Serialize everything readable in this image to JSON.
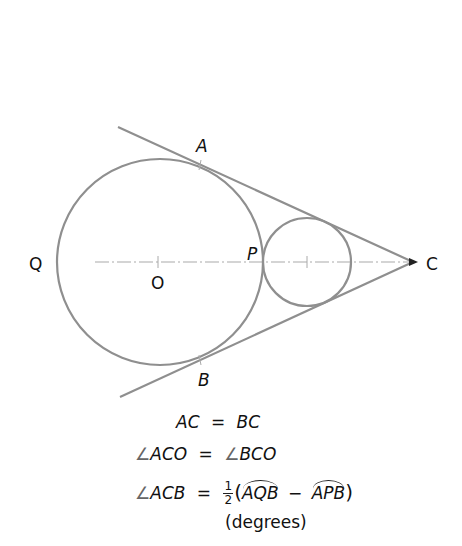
{
  "diagram": {
    "colors": {
      "stroke": "#8f8f8f",
      "axis": "#aaaaaa",
      "text": "#111111"
    },
    "big_circle": {
      "cx": 160,
      "cy": 262,
      "r": 103
    },
    "small_circle": {
      "cx": 307,
      "cy": 262,
      "r": 44
    },
    "apex": {
      "x": 415,
      "y": 262
    },
    "points": {
      "A": "A",
      "B": "B",
      "P": "P",
      "Q": "Q",
      "O": "O",
      "C": "C"
    }
  },
  "equations": {
    "line1": {
      "lhs": "AC",
      "op": "=",
      "rhs": "BC"
    },
    "line2": {
      "angle": "∠",
      "lhs": "ACO",
      "op": "=",
      "rhs": "BCO"
    },
    "line3": {
      "angle": "∠",
      "lhs": "ACB",
      "op": "=",
      "frac_num": "1",
      "frac_den": "2",
      "open": "(",
      "arc1": "AQB",
      "minus": "−",
      "arc2": "APB",
      "close": ")"
    },
    "note": "(degrees)"
  }
}
